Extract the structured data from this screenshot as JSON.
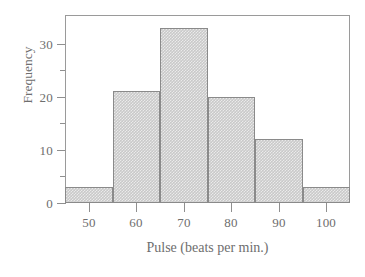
{
  "chart_data": {
    "type": "bar",
    "title": "",
    "xlabel": "Pulse (beats per min.)",
    "ylabel": "Frequency",
    "categories": [
      "45-55",
      "55-65",
      "65-75",
      "75-85",
      "85-95",
      "95-105"
    ],
    "bin_edges": [
      45,
      55,
      65,
      75,
      85,
      95,
      105
    ],
    "values": [
      3,
      21,
      33,
      20,
      12,
      3
    ],
    "xlim": [
      45,
      105
    ],
    "ylim": [
      0,
      35.4
    ],
    "xticks": [
      50,
      60,
      70,
      80,
      90,
      100
    ],
    "xtick_labels": [
      "50",
      "60",
      "70",
      "80",
      "90",
      "100"
    ],
    "yticks": [
      0,
      10,
      20,
      30
    ],
    "ytick_labels": [
      "0",
      "10",
      "20",
      "30"
    ],
    "yticks_minor": [
      5,
      15,
      25
    ],
    "grid": false,
    "legend": null,
    "bar_fill_color": "#c9c9c9",
    "bar_edge_color": "#8a8a8a",
    "frame_color": "#9a9a9a",
    "text_color": "#6e6e6e",
    "background_color": "#ffffff"
  }
}
